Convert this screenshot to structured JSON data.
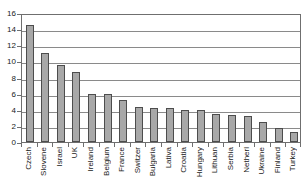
{
  "chart_data": {
    "type": "bar",
    "title": "",
    "xlabel": "",
    "ylabel": "",
    "ylim": [
      0,
      16
    ],
    "ytick_step": 2,
    "yticks": [
      0,
      2,
      4,
      6,
      8,
      10,
      12,
      14,
      16
    ],
    "grid": true,
    "legend": "none",
    "bar_color": "#a8a8a8",
    "bar_edge_color": "#4d4d4d",
    "axis_color": "#6f6f6f",
    "gridline_color": "#8a8a8a",
    "categories": [
      "Czech",
      "Slovene",
      "Israel",
      "UK",
      "Ireland",
      "Belgium",
      "France",
      "Switzer",
      "Bulgaria",
      "Lativa",
      "Croatia",
      "Hungary",
      "Lithuan",
      "Serbia",
      "Netherl",
      "Ukraine",
      "Finland",
      "Turkey"
    ],
    "values": [
      14.5,
      11.0,
      9.5,
      8.7,
      6.0,
      5.9,
      5.2,
      4.4,
      4.2,
      4.2,
      4.0,
      4.0,
      3.5,
      3.4,
      3.2,
      2.5,
      1.8,
      1.3
    ]
  }
}
